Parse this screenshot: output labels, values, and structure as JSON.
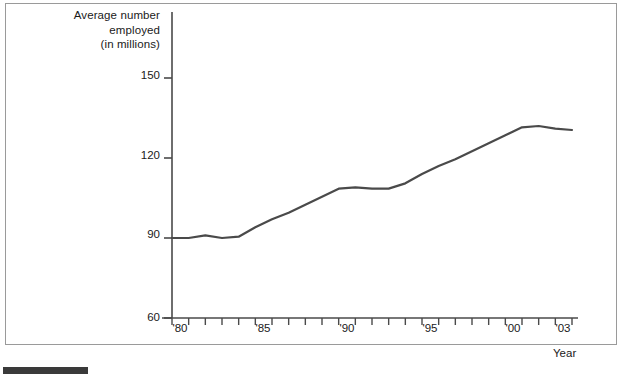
{
  "figure": {
    "footer_rule_color": "#3a3a3a",
    "frame_color": "#9a9a9a",
    "line_color": "#4a4a4a",
    "axis_color": "#4a4a4a",
    "text_color": "#1a1a1a"
  },
  "chart_data": {
    "type": "line",
    "title": "",
    "ylabel": "Average number\nemployed\n(in millions)",
    "ylabel_lines": [
      "Average number",
      "employed",
      "(in millions)"
    ],
    "xlabel": "Year",
    "ylim": [
      60,
      150
    ],
    "xlim": [
      1979,
      2003
    ],
    "yticks": [
      60,
      90,
      120,
      150
    ],
    "ytick_labels": [
      "60",
      "90",
      "120",
      "150"
    ],
    "xticks": [
      1979,
      1980,
      1981,
      1982,
      1983,
      1984,
      1985,
      1986,
      1987,
      1988,
      1989,
      1990,
      1991,
      1992,
      1993,
      1994,
      1995,
      1996,
      1997,
      1998,
      1999,
      2000,
      2001,
      2002,
      2003
    ],
    "xtick_labels": [
      {
        "x": 1980,
        "label": "'80"
      },
      {
        "x": 1985,
        "label": "'85"
      },
      {
        "x": 1990,
        "label": "'90"
      },
      {
        "x": 1995,
        "label": "'95"
      },
      {
        "x": 2000,
        "label": "'00"
      },
      {
        "x": 2003,
        "label": "'03"
      }
    ],
    "grid": false,
    "legend": null,
    "x": [
      1979,
      1980,
      1981,
      1982,
      1983,
      1984,
      1985,
      1986,
      1987,
      1988,
      1989,
      1990,
      1991,
      1992,
      1993,
      1994,
      1995,
      1996,
      1997,
      1998,
      1999,
      2000,
      2001,
      2002,
      2003
    ],
    "values": [
      90,
      90,
      91,
      90,
      90.5,
      94,
      97,
      99.5,
      102.5,
      105.5,
      108.5,
      109,
      108.5,
      108.5,
      110.5,
      114,
      117,
      119.5,
      122.5,
      125.5,
      128.5,
      131.5,
      132,
      131,
      130.5
    ],
    "series": [
      {
        "name": "Average number employed (in millions)",
        "values": [
          90,
          90,
          91,
          90,
          90.5,
          94,
          97,
          99.5,
          102.5,
          105.5,
          108.5,
          109,
          108.5,
          108.5,
          110.5,
          114,
          117,
          119.5,
          122.5,
          125.5,
          128.5,
          131.5,
          132,
          131,
          130.5
        ]
      }
    ]
  }
}
